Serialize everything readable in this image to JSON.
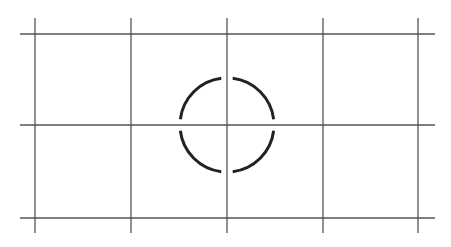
{
  "diagram": {
    "type": "grid-with-circle-reticle",
    "colors": {
      "background": "#ffffff",
      "grid_line": "#555555",
      "circle": "#222222"
    },
    "grid": {
      "vertical_lines_x": [
        35,
        131,
        227,
        323,
        418
      ],
      "vertical_span_y": [
        18,
        233
      ],
      "horizontal_lines_y": [
        34,
        125,
        218
      ],
      "horizontal_span_x": [
        20,
        435
      ],
      "stroke_width": 1.3
    },
    "circle": {
      "cx": 227,
      "cy": 125,
      "r": 47,
      "stroke_width": 3,
      "gap_degrees": 7,
      "segments": 4
    }
  }
}
